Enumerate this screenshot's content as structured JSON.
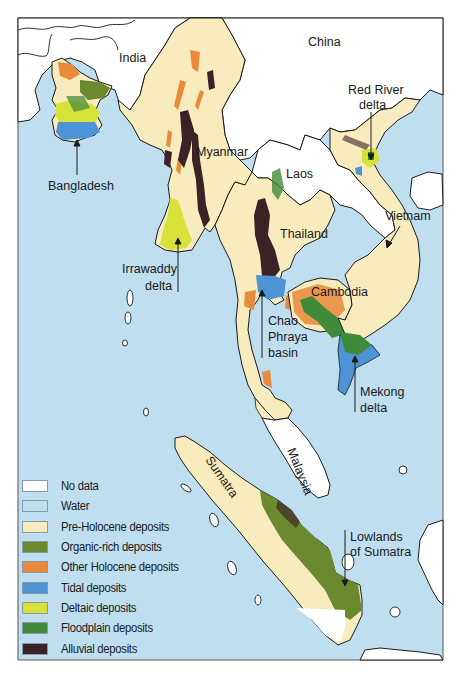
{
  "colors": {
    "no_data": "#ffffff",
    "water": "#bfdff0",
    "pre_holocene": "#f8ecbf",
    "organic_rich": "#6b8a2f",
    "other_holocene": "#e88a3a",
    "tidal": "#4d93d6",
    "deltaic": "#d6e23a",
    "floodplain": "#3f8a3a",
    "alluvial": "#3a2226",
    "border": "#1a1a1a"
  },
  "labels": {
    "india": "India",
    "china": "China",
    "myanmar": "Myanmar",
    "laos": "Laos",
    "thailand": "Thailand",
    "cambodia": "Cambodia",
    "vietnam": "Vietnam",
    "malaysia": "Malaysia",
    "sumatra": "Sumatra",
    "bangladesh": "Bangladesh",
    "red_river_1": "Red River",
    "red_river_2": "delta",
    "irrawaddy_1": "Irrawaddy",
    "irrawaddy_2": "delta",
    "chao_1": "Chao",
    "chao_2": "Phraya",
    "chao_3": "basin",
    "mekong_1": "Mekong",
    "mekong_2": "delta",
    "lowlands_1": "Lowlands",
    "lowlands_2": "of Sumatra"
  },
  "legend": {
    "items": [
      {
        "label": "No data",
        "color": "#ffffff"
      },
      {
        "label": "Water",
        "color": "#bfdff0"
      },
      {
        "label": "Pre-Holocene deposits",
        "color": "#f8ecbf"
      },
      {
        "label": "Organic-rich deposits",
        "color": "#6b8a2f"
      },
      {
        "label": "Other Holocene deposits",
        "color": "#e88a3a"
      },
      {
        "label": "Tidal deposits",
        "color": "#4d93d6"
      },
      {
        "label": "Deltaic deposits",
        "color": "#d6e23a"
      },
      {
        "label": "Floodplain deposits",
        "color": "#3f8a3a"
      },
      {
        "label": "Alluvial deposits",
        "color": "#3a2226"
      }
    ]
  }
}
